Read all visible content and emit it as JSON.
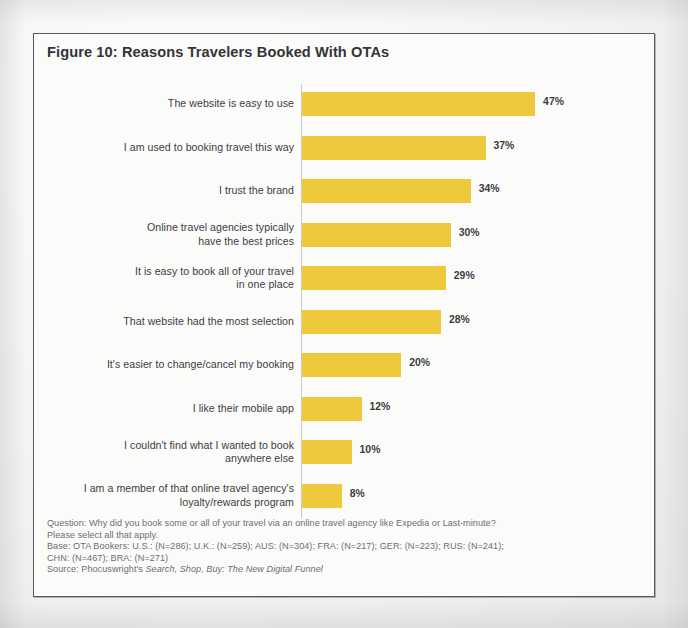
{
  "page": {
    "page_number": "154"
  },
  "figure": {
    "title": "Figure 10: Reasons Travelers Booked With OTAs",
    "accent_color": "#EFC93C",
    "axis_color": "#C9C9C7",
    "border_color": "#58585A"
  },
  "chart_data": {
    "type": "bar",
    "orientation": "horizontal",
    "title": "Figure 10: Reasons Travelers Booked With OTAs",
    "xlabel": "",
    "ylabel": "",
    "xlim": [
      0,
      50
    ],
    "grid": false,
    "legend": null,
    "value_suffix": "%",
    "categories": [
      "The website is easy to use",
      "I am used to booking travel this way",
      "I trust the brand",
      "Online travel agencies typically have the best prices",
      "It is easy to book all of your travel in one place",
      "That website had the most selection",
      "It's easier to change/cancel my booking",
      "I like their mobile app",
      "I couldn't find what I wanted to book anywhere else",
      "I am a member of that online travel agency's loyalty/rewards program"
    ],
    "category_lines": [
      [
        "The website is easy to use"
      ],
      [
        "I am used to booking travel this way"
      ],
      [
        "I trust the brand"
      ],
      [
        "Online travel agencies typically",
        "have the best prices"
      ],
      [
        "It is easy to book all of your travel",
        "in one place"
      ],
      [
        "That website had the most selection"
      ],
      [
        "It's easier to change/cancel my booking"
      ],
      [
        "I like their mobile app"
      ],
      [
        "I couldn't find what I wanted to book",
        "anywhere else"
      ],
      [
        "I am a member of that online travel agency's",
        "loyalty/rewards program"
      ]
    ],
    "values": [
      47,
      37,
      34,
      30,
      29,
      28,
      20,
      12,
      10,
      8
    ],
    "value_labels": [
      "47%",
      "37%",
      "34%",
      "30%",
      "29%",
      "28%",
      "20%",
      "12%",
      "10%",
      "8%"
    ]
  },
  "notes": {
    "question_line1": "Question: Why did you book some or all of your travel via an online travel agency like Expedia or Last-minute?",
    "question_line2": "Please select all that apply.",
    "base_line1": "Base: OTA Bookers: U.S.: (N=286); U.K.: (N=259); AUS: (N=304); FRA: (N=217); GER: (N=223); RUS: (N=241);",
    "base_line2": "CHN: (N=467); BRA: (N=271)",
    "source_prefix": "Source: Phocuswright's ",
    "source_italic": "Search, Shop, Buy: The New Digital Funnel"
  }
}
